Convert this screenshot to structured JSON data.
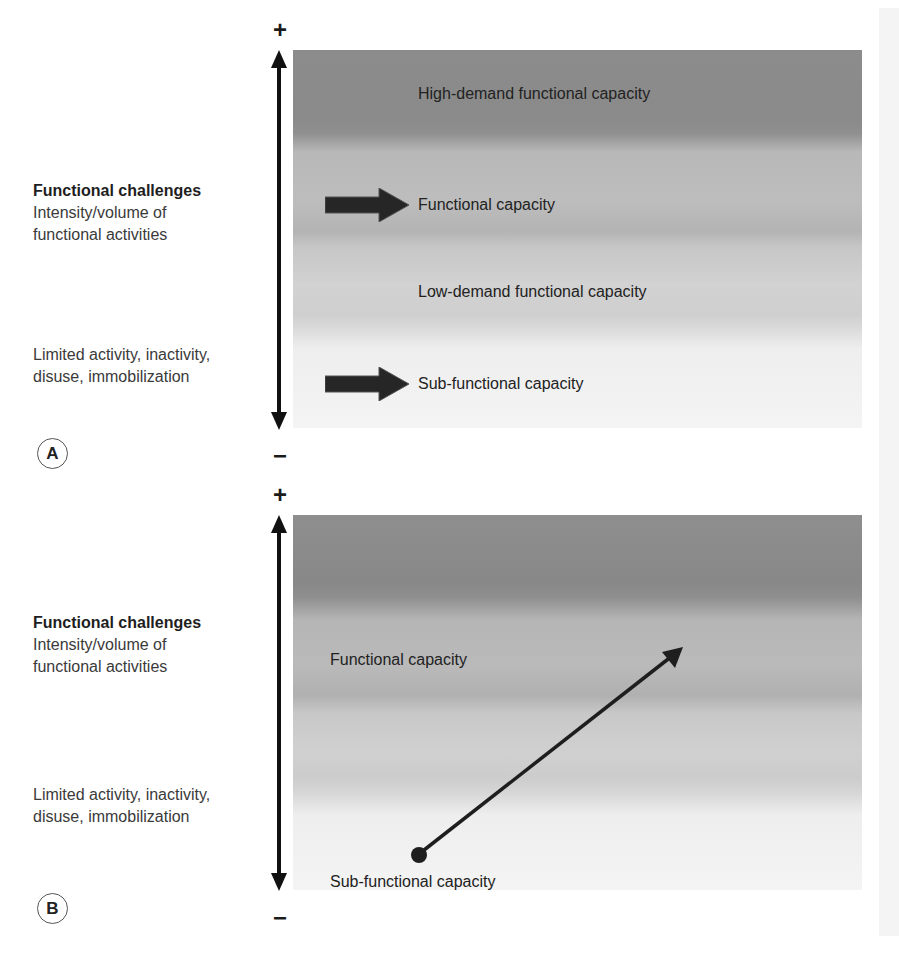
{
  "panels": [
    {
      "letter": "A",
      "axis": {
        "plus": "+",
        "minus": "−"
      },
      "left_labels": {
        "heading": "Functional challenges",
        "line1": "Intensity/volume of",
        "line2": "functional activities",
        "low_line1": "Limited activity, inactivity,",
        "low_line2": "disuse, immobilization"
      },
      "bands": [
        {
          "label": "High-demand functional capacity",
          "arrow": false
        },
        {
          "label": "Functional capacity",
          "arrow": true
        },
        {
          "label": "Low-demand functional capacity",
          "arrow": false
        },
        {
          "label": "Sub-functional capacity",
          "arrow": true
        }
      ]
    },
    {
      "letter": "B",
      "axis": {
        "plus": "+",
        "minus": "−"
      },
      "left_labels": {
        "heading": "Functional challenges",
        "line1": "Intensity/volume of",
        "line2": "functional activities",
        "low_line1": "Limited activity, inactivity,",
        "low_line2": "disuse, immobilization"
      },
      "bands": [
        {
          "label": "Functional capacity"
        },
        {
          "label": "Sub-functional capacity"
        }
      ],
      "progression_arrow": {
        "from": "Sub-functional capacity",
        "to": "Functional capacity"
      }
    }
  ],
  "colors": {
    "band_dark": "#8c8c8c",
    "band_mid": "#bdbdbd",
    "band_light": "#d2d2d2",
    "band_lightest": "#f4f4f4",
    "arrow": "#1a1a1a"
  }
}
